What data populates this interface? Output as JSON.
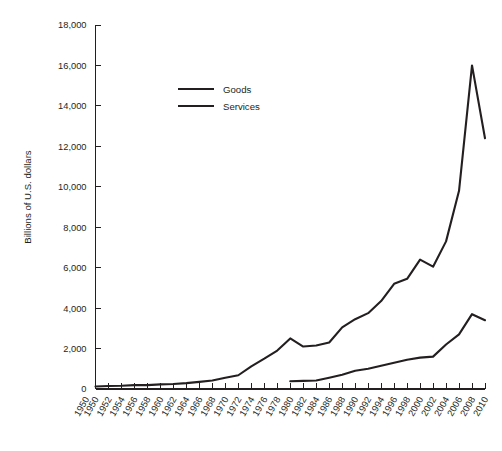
{
  "chart_data": {
    "type": "line",
    "title": "",
    "xlabel": "",
    "ylabel": "Billions of U.S. dollars",
    "ylim": [
      0,
      18000
    ],
    "ytick_labels": [
      "0",
      "2,000",
      "4,000",
      "6,000",
      "8,000",
      "10,000",
      "12,000",
      "14,000",
      "16,000",
      "18,000"
    ],
    "ytick_values": [
      0,
      2000,
      4000,
      6000,
      8000,
      10000,
      12000,
      14000,
      16000,
      18000
    ],
    "xlim": [
      1950,
      2010
    ],
    "grid": false,
    "legend_position": "upper-center-left",
    "x_axis_duplicate_first_label": true,
    "xtick_labels": [
      "1950",
      "1950",
      "1952",
      "1954",
      "1956",
      "1958",
      "1960",
      "1962",
      "1964",
      "1966",
      "1968",
      "1970",
      "1972",
      "1974",
      "1976",
      "1978",
      "1980",
      "1982",
      "1984",
      "1986",
      "1988",
      "1990",
      "1992",
      "1994",
      "1996",
      "1998",
      "2000",
      "2002",
      "2004",
      "2006",
      "2008",
      "2010"
    ],
    "x": [
      1950,
      1952,
      1954,
      1956,
      1958,
      1960,
      1962,
      1964,
      1966,
      1968,
      1970,
      1972,
      1974,
      1976,
      1978,
      1980,
      1982,
      1984,
      1986,
      1988,
      1990,
      1992,
      1994,
      1996,
      1998,
      2000,
      2002,
      2004,
      2006,
      2008,
      2010
    ],
    "series": [
      {
        "name": "Goods",
        "color": "#231f20",
        "values": [
          120,
          150,
          160,
          190,
          190,
          230,
          250,
          290,
          350,
          420,
          560,
          680,
          1120,
          1500,
          1900,
          2500,
          2100,
          2150,
          2300,
          3050,
          3450,
          3750,
          4350,
          5200,
          5450,
          6400,
          6050,
          7300,
          9800,
          16000,
          12400
        ]
      },
      {
        "name": "Services",
        "color": "#231f20",
        "values": [
          null,
          null,
          null,
          null,
          null,
          null,
          null,
          null,
          null,
          null,
          null,
          null,
          null,
          null,
          null,
          380,
          400,
          420,
          560,
          700,
          900,
          1000,
          1150,
          1300,
          1450,
          1550,
          1600,
          2200,
          2700,
          3700,
          3400
        ]
      }
    ],
    "legend": [
      {
        "label": "Goods"
      },
      {
        "label": "Services"
      }
    ]
  }
}
